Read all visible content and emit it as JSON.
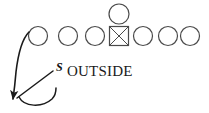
{
  "diagram": {
    "type": "football-play-diagram",
    "title": "OUTSIDE",
    "background_color": "#ffffff",
    "stroke_color": "#4a4a4a",
    "ink_color": "#1a1a1a",
    "canvas": {
      "width": 209,
      "height": 113
    },
    "labels": {
      "outside": "OUTSIDE",
      "safety": "S"
    },
    "offense": {
      "line_label": "offensive-line",
      "player_radius": 9.5,
      "line_y": 36,
      "players": [
        {
          "id": "lineman-1",
          "shape": "circle",
          "x": 38,
          "y": 36
        },
        {
          "id": "lineman-2",
          "shape": "circle",
          "x": 68,
          "y": 36
        },
        {
          "id": "lineman-3",
          "shape": "circle",
          "x": 95,
          "y": 36
        },
        {
          "id": "center",
          "shape": "crossed-square",
          "x": 119,
          "y": 36,
          "size": 19
        },
        {
          "id": "lineman-4",
          "shape": "circle",
          "x": 143,
          "y": 36
        },
        {
          "id": "lineman-5",
          "shape": "circle",
          "x": 168,
          "y": 36
        },
        {
          "id": "lineman-6",
          "shape": "circle",
          "x": 190,
          "y": 36
        }
      ],
      "backfield": [
        {
          "id": "quarterback",
          "shape": "circle",
          "x": 119,
          "y": 14,
          "radius": 10
        }
      ]
    },
    "defense": {
      "safety": {
        "id": "safety",
        "label": "S",
        "x": 57,
        "y": 70
      }
    },
    "routes": [
      {
        "id": "motion-arrow",
        "path": "M 29 32 C 21 40, 18 55, 16 72 C 15 84, 14 92, 13 99",
        "arrowhead": true,
        "arrow_tip": {
          "x": 13,
          "y": 101
        }
      },
      {
        "id": "safety-leader-line",
        "path": "M 52 70 L 16 99",
        "arrowhead": false
      },
      {
        "id": "safety-hook",
        "path": "M 18 95 C 22 105, 40 107, 50 99 C 54 96, 55 92, 55 89",
        "arrowhead": false
      }
    ]
  }
}
